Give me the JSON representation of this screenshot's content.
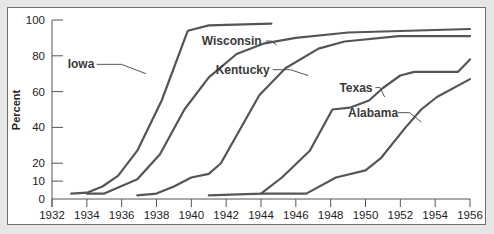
{
  "chart_data": {
    "type": "line",
    "title": "",
    "xlabel": "",
    "ylabel": "Percent",
    "xlim": [
      1932,
      1956
    ],
    "ylim": [
      0,
      100
    ],
    "x_ticks": [
      1932,
      1934,
      1936,
      1938,
      1940,
      1942,
      1944,
      1946,
      1948,
      1950,
      1952,
      1954,
      1956
    ],
    "y_ticks": [
      0,
      10,
      20,
      40,
      60,
      80,
      100
    ],
    "grid": false,
    "legend": "inline labels",
    "line_color": "#555555",
    "series": [
      {
        "name": "Iowa",
        "label_pos": [
          1932.9,
          73
        ],
        "leader_to": [
          1937.4,
          70
        ],
        "points": [
          [
            1933.1,
            3
          ],
          [
            1934,
            3.5
          ],
          [
            1934.9,
            7
          ],
          [
            1935.8,
            13
          ],
          [
            1936.9,
            27
          ],
          [
            1938.3,
            55
          ],
          [
            1939.8,
            94
          ],
          [
            1941,
            97
          ],
          [
            1944.6,
            98
          ]
        ]
      },
      {
        "name": "Wisconsin",
        "label_pos": [
          1940.6,
          86
        ],
        "leader_to": [
          1944.9,
          86
        ],
        "points": [
          [
            1934,
            3
          ],
          [
            1935,
            3
          ],
          [
            1936.9,
            11
          ],
          [
            1938.2,
            25
          ],
          [
            1939.6,
            50
          ],
          [
            1941,
            68
          ],
          [
            1942.6,
            81
          ],
          [
            1944.2,
            87
          ],
          [
            1946,
            90
          ],
          [
            1949,
            93
          ],
          [
            1956,
            95
          ]
        ]
      },
      {
        "name": "Kentucky",
        "label_pos": [
          1941.4,
          70
        ],
        "leader_to": [
          1946.7,
          69
        ],
        "points": [
          [
            1936.9,
            2
          ],
          [
            1938,
            3
          ],
          [
            1939,
            7
          ],
          [
            1940,
            12
          ],
          [
            1941,
            14
          ],
          [
            1941.7,
            20
          ],
          [
            1943.9,
            58
          ],
          [
            1945.4,
            73
          ],
          [
            1947.3,
            84
          ],
          [
            1948.8,
            88
          ],
          [
            1951.9,
            91
          ],
          [
            1956,
            91
          ]
        ]
      },
      {
        "name": "Texas",
        "label_pos": [
          1948.5,
          60
        ],
        "leader_to": [
          1951.1,
          57
        ],
        "points": [
          [
            1941,
            2
          ],
          [
            1944,
            3
          ],
          [
            1945.2,
            12
          ],
          [
            1946.8,
            27
          ],
          [
            1948.1,
            50
          ],
          [
            1949.1,
            51
          ],
          [
            1950.2,
            55
          ],
          [
            1951,
            62
          ],
          [
            1952,
            69
          ],
          [
            1952.8,
            71
          ],
          [
            1955.3,
            71
          ],
          [
            1956,
            78
          ]
        ]
      },
      {
        "name": "Alabama",
        "label_pos": [
          1949,
          46
        ],
        "leader_to": [
          1953.2,
          43
        ],
        "points": [
          [
            1944,
            3
          ],
          [
            1946.6,
            3
          ],
          [
            1948.3,
            12
          ],
          [
            1950,
            16
          ],
          [
            1950.9,
            23
          ],
          [
            1952.3,
            40
          ],
          [
            1953.2,
            50
          ],
          [
            1954.1,
            57
          ],
          [
            1956,
            67
          ]
        ]
      }
    ]
  }
}
